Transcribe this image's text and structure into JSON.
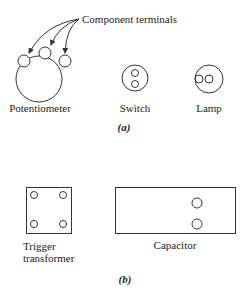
{
  "figure": {
    "part_a": {
      "callout": "Component terminals",
      "components": [
        {
          "name": "Potentiometer",
          "terminals": 3
        },
        {
          "name": "Switch",
          "terminals": 2
        },
        {
          "name": "Lamp",
          "terminals": 2
        }
      ],
      "caption": "(a)"
    },
    "part_b": {
      "components": [
        {
          "name": "Trigger transformer",
          "line1": "Trigger",
          "line2": "transformer",
          "terminals": 4
        },
        {
          "name": "Capacitor",
          "terminals": 2
        }
      ],
      "caption": "(b)"
    },
    "colors": {
      "stroke": "#333333",
      "background": "#ffffff"
    }
  }
}
